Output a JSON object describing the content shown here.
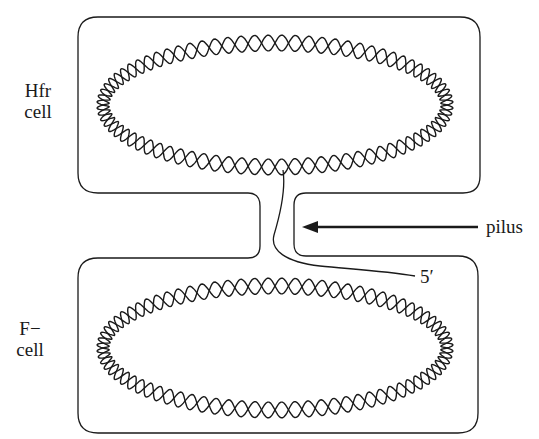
{
  "diagram": {
    "type": "bacterial conjugation (Hfr x F- mating)",
    "labels": {
      "hfr_cell": [
        "Hfr",
        "cell"
      ],
      "f_minus_cell": [
        "F−",
        "cell"
      ],
      "pilus": "pilus",
      "five_prime": "5′"
    },
    "nodes": [
      {
        "id": "hfr_cell",
        "label": "Hfr cell",
        "shape": "rounded-rectangle",
        "contains": "circular double-helix chromosome"
      },
      {
        "id": "f_minus_cell",
        "label": "F− cell",
        "shape": "rounded-rectangle",
        "contains": "circular double-helix chromosome"
      },
      {
        "id": "pilus",
        "label": "pilus",
        "shape": "channel connecting the two cells"
      }
    ],
    "edges": [
      {
        "from": "hfr_cell",
        "to": "f_minus_cell",
        "via": "pilus",
        "description": "single DNA strand with 5′ end transferred through the pilus"
      },
      {
        "from": "pilus_label",
        "to": "pilus",
        "description": "arrow pointing to pilus"
      }
    ],
    "colors": {
      "line": "#1a1a1a",
      "background": "#ffffff"
    }
  }
}
